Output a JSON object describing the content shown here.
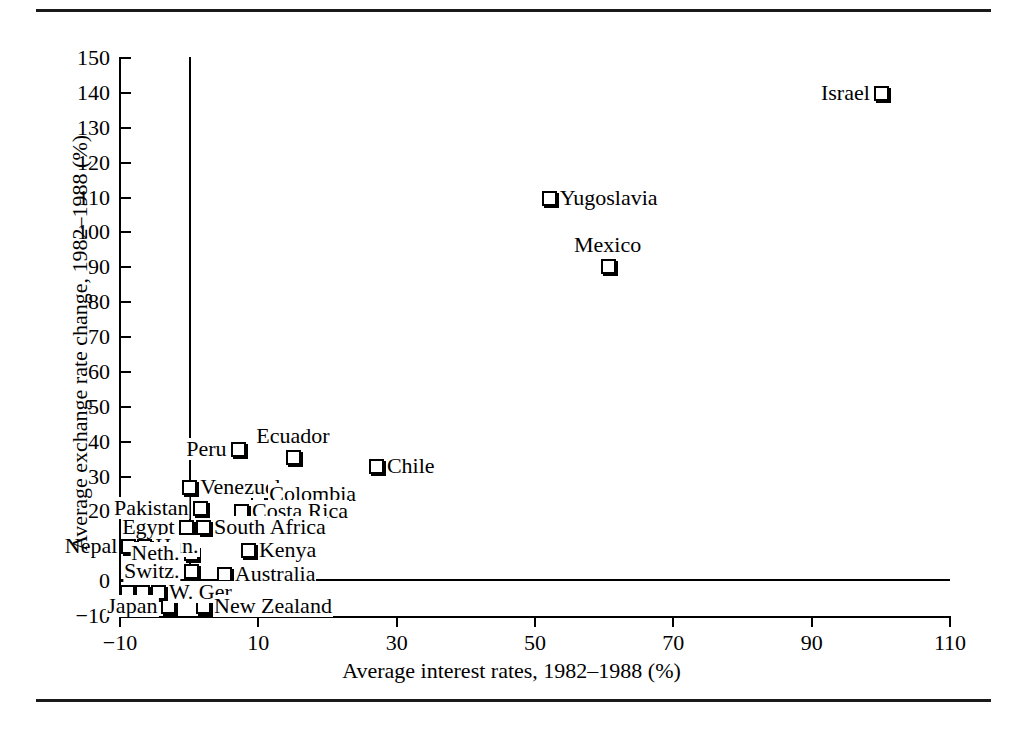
{
  "figure": {
    "has_top_rule": true,
    "has_bottom_rule": true,
    "ink_color": "#000000",
    "background_color": "#ffffff"
  },
  "chart_data": {
    "type": "scatter",
    "title": "",
    "xlabel": "Average interest rates, 1982–1988 (%)",
    "ylabel": "Average exchange rate change, 1982–1988 (%)",
    "xlim": [
      -10,
      110
    ],
    "ylim": [
      -10,
      150
    ],
    "xticks": [
      -10,
      10,
      30,
      50,
      70,
      90,
      110
    ],
    "xtick_labels": [
      "−10",
      "10",
      "30",
      "50",
      "70",
      "90",
      "110"
    ],
    "yticks": [
      -10,
      0,
      10,
      20,
      30,
      40,
      50,
      60,
      70,
      80,
      90,
      100,
      110,
      120,
      130,
      140,
      150
    ],
    "ytick_labels": [
      "−10",
      "0",
      "10",
      "20",
      "30",
      "40",
      "50",
      "60",
      "70",
      "80",
      "90",
      "100",
      "110",
      "120",
      "130",
      "140",
      "150"
    ],
    "grid": false,
    "legend": "none",
    "zero_reference_lines": {
      "horizontal_at_y": 0,
      "vertical_at_x": 0
    },
    "marker_style": "open-square-with-drop-shadow",
    "points": [
      {
        "label": "Israel",
        "x": 100.0,
        "y": 140.0,
        "label_pos": "left"
      },
      {
        "label": "Yugoslavia",
        "x": 52.0,
        "y": 110.0,
        "label_pos": "right"
      },
      {
        "label": "Mexico",
        "x": 60.5,
        "y": 90.5,
        "label_pos": "above"
      },
      {
        "label": "Peru",
        "x": 7.0,
        "y": 38.0,
        "label_pos": "left"
      },
      {
        "label": "Ecuador",
        "x": 15.0,
        "y": 35.5,
        "label_pos": "above"
      },
      {
        "label": "Chile",
        "x": 27.0,
        "y": 33.0,
        "label_pos": "right"
      },
      {
        "label": "Venezuela",
        "x": 0.0,
        "y": 27.0,
        "label_pos": "right"
      },
      {
        "label": "Colombia",
        "x": 10.0,
        "y": 25.0,
        "label_pos": "right"
      },
      {
        "label": "Pakistan",
        "x": 1.5,
        "y": 21.0,
        "label_pos": "left"
      },
      {
        "label": "Costa Rica",
        "x": 7.5,
        "y": 20.0,
        "label_pos": "right"
      },
      {
        "label": "South Africa",
        "x": 2.0,
        "y": 15.5,
        "label_pos": "right"
      },
      {
        "label": "Egypt",
        "x": -0.5,
        "y": 15.5,
        "label_pos": "left"
      },
      {
        "label": "Hun.",
        "x": -6.5,
        "y": 10.0,
        "label_pos": "right"
      },
      {
        "label": "Nepal",
        "x": -8.8,
        "y": 10.0,
        "label_pos": "left"
      },
      {
        "label": "Kenya",
        "x": 8.5,
        "y": 9.0,
        "label_pos": "right"
      },
      {
        "label": "Neth.",
        "x": 0.2,
        "y": 8.0,
        "label_pos": "left"
      },
      {
        "label": "Switz.",
        "x": 0.2,
        "y": 3.0,
        "label_pos": "left"
      },
      {
        "label": "Australia",
        "x": 5.0,
        "y": 2.0,
        "label_pos": "right"
      },
      {
        "label": "W. Ger.",
        "x": -4.5,
        "y": -3.0,
        "label_pos": "right"
      },
      {
        "label": "",
        "x": -6.8,
        "y": -3.0,
        "label_pos": "none"
      },
      {
        "label": "",
        "x": -9.0,
        "y": -3.0,
        "label_pos": "none"
      },
      {
        "label": "Japan",
        "x": -3.0,
        "y": -7.0,
        "label_pos": "left"
      },
      {
        "label": "New Zealand",
        "x": 2.0,
        "y": -7.0,
        "label_pos": "right"
      }
    ]
  }
}
